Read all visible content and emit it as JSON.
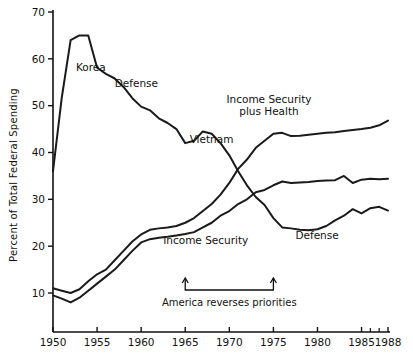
{
  "chart_data": {
    "type": "line",
    "title": "",
    "xlabel": "",
    "ylabel": "Percent of Total Federal Spending",
    "xlim": [
      1950,
      1988
    ],
    "ylim": [
      0,
      70
    ],
    "grid": false,
    "legend_position": "inline-labels",
    "x_ticks": [
      1950,
      1955,
      1960,
      1965,
      1970,
      1975,
      1980,
      1985,
      1988
    ],
    "x_tick_labels": [
      "1950",
      "1955",
      "1960",
      "1965",
      "1970",
      "1975",
      "1980",
      "1985",
      "1988"
    ],
    "x_minor_ticks": [
      1986,
      1987
    ],
    "y_ticks": [
      10,
      20,
      30,
      40,
      50,
      60,
      70
    ],
    "y_tick_labels": [
      "10",
      "20",
      "30",
      "40",
      "50",
      "60",
      "70"
    ],
    "series": [
      {
        "name": "Defense",
        "x": [
          1950,
          1951,
          1952,
          1953,
          1954,
          1955,
          1956,
          1957,
          1958,
          1959,
          1960,
          1961,
          1962,
          1963,
          1964,
          1965,
          1966,
          1967,
          1968,
          1969,
          1970,
          1971,
          1972,
          1973,
          1974,
          1975,
          1976,
          1977,
          1978,
          1979,
          1980,
          1981,
          1982,
          1983,
          1984,
          1985,
          1986,
          1987,
          1988
        ],
        "values": [
          36.0,
          51.8,
          64.0,
          65.0,
          65.0,
          58.1,
          56.8,
          55.8,
          54.0,
          51.6,
          49.8,
          49.0,
          47.3,
          46.3,
          45.0,
          42.0,
          42.5,
          44.5,
          44.0,
          42.0,
          39.4,
          36.0,
          33.0,
          30.5,
          28.8,
          26.0,
          24.0,
          23.8,
          23.5,
          23.4,
          23.6,
          24.3,
          25.5,
          26.5,
          27.9,
          27.0,
          28.1,
          28.4,
          27.6
        ]
      },
      {
        "name": "Income Security plus Health",
        "x": [
          1950,
          1951,
          1952,
          1953,
          1954,
          1955,
          1956,
          1957,
          1958,
          1959,
          1960,
          1961,
          1962,
          1963,
          1964,
          1965,
          1966,
          1967,
          1968,
          1969,
          1970,
          1971,
          1972,
          1973,
          1974,
          1975,
          1976,
          1977,
          1978,
          1979,
          1980,
          1981,
          1982,
          1983,
          1984,
          1985,
          1986,
          1987,
          1988
        ],
        "values": [
          11.0,
          10.5,
          10.0,
          10.8,
          12.5,
          14.0,
          15.0,
          17.0,
          19.0,
          21.0,
          22.5,
          23.5,
          23.8,
          24.0,
          24.3,
          25.0,
          26.0,
          27.5,
          29.0,
          31.0,
          33.5,
          36.5,
          38.5,
          41.0,
          42.5,
          44.0,
          44.2,
          43.5,
          43.6,
          43.8,
          44.0,
          44.2,
          44.3,
          44.6,
          44.8,
          45.0,
          45.3,
          45.8,
          46.8
        ]
      },
      {
        "name": "Income Security",
        "x": [
          1950,
          1951,
          1952,
          1953,
          1954,
          1955,
          1956,
          1957,
          1958,
          1959,
          1960,
          1961,
          1962,
          1963,
          1964,
          1965,
          1966,
          1967,
          1968,
          1969,
          1970,
          1971,
          1972,
          1973,
          1974,
          1975,
          1976,
          1977,
          1978,
          1979,
          1980,
          1981,
          1982,
          1983,
          1984,
          1985,
          1986,
          1987,
          1988
        ],
        "values": [
          9.5,
          8.8,
          8.0,
          9.0,
          10.5,
          12.0,
          13.5,
          15.0,
          17.0,
          19.0,
          20.8,
          21.5,
          21.8,
          22.0,
          22.3,
          22.6,
          23.0,
          24.0,
          25.0,
          26.5,
          27.5,
          29.0,
          30.0,
          31.5,
          32.0,
          33.0,
          33.8,
          33.5,
          33.6,
          33.7,
          33.9,
          34.0,
          34.1,
          35.0,
          33.5,
          34.2,
          34.4,
          34.3,
          34.4
        ]
      }
    ],
    "annotations": [
      {
        "name": "korea",
        "label": "Korea",
        "x": 1952.6,
        "y": 57.5
      },
      {
        "name": "defense-upper",
        "label": "Defense",
        "x": 1957.0,
        "y": 54.0
      },
      {
        "name": "vietnam",
        "label": "Vietnam",
        "x": 1965.5,
        "y": 42.0
      },
      {
        "name": "income-security-plus-health",
        "label": "Income Security\nplus Health",
        "x": 1974.5,
        "y": 50.5
      },
      {
        "name": "income-security",
        "label": "Income Security",
        "x": 1962.5,
        "y": 20.5
      },
      {
        "name": "defense-lower",
        "label": "Defense",
        "x": 1977.5,
        "y": 21.5
      },
      {
        "name": "america-reverses",
        "label": "America reverses priorities",
        "x": 1970.0,
        "y": 5.0
      }
    ],
    "span_annotation": {
      "label": "America reverses priorities",
      "from_year": 1965,
      "to_year": 1975
    },
    "colors": {
      "line": "#1a1a1a",
      "axis": "#111111",
      "background": "#ffffff"
    }
  },
  "labels": {
    "y_axis_title": "Percent of Total Federal Spending"
  }
}
